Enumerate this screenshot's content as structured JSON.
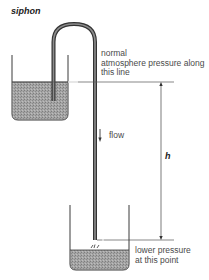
{
  "title": "siphon",
  "labels": {
    "upper_line": [
      "normal",
      "atmosphere pressure along",
      "this line"
    ],
    "flow": "flow",
    "height": "h",
    "lower_point": [
      "lower pressure",
      "at this point"
    ]
  },
  "colors": {
    "water_fill": "#9a9a9a",
    "outline": "#3a3a3a",
    "tube": "#555555",
    "text": "#4a4a4a"
  }
}
